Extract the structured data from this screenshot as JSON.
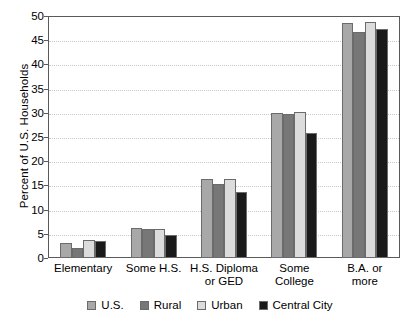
{
  "chart_data": {
    "type": "bar",
    "title": "",
    "xlabel": "",
    "ylabel": "Percent of U.S. Households",
    "ylim": [
      0,
      50
    ],
    "yticks": [
      0,
      5,
      10,
      15,
      20,
      25,
      30,
      35,
      40,
      45,
      50
    ],
    "ytick_labels": [
      "0",
      "5",
      "10",
      "15",
      "20",
      "25",
      "30",
      "35",
      "40",
      "45",
      "50"
    ],
    "grid": true,
    "grid_axis": "y",
    "legend_position": "bottom",
    "categories": [
      "Elementary",
      "Some H.S.",
      "H.S. Diploma or GED",
      "Some College",
      "B.A. or more"
    ],
    "category_lines": [
      [
        "Elementary",
        ""
      ],
      [
        "Some H.S.",
        ""
      ],
      [
        "H.S. Diploma",
        "or GED"
      ],
      [
        "Some",
        "College"
      ],
      [
        "B.A. or",
        "more"
      ]
    ],
    "series": [
      {
        "name": "U.S.",
        "color": "#a8a8a8",
        "values": [
          3.2,
          6.3,
          16.3,
          29.9,
          48.5
        ]
      },
      {
        "name": "Rural",
        "color": "#777777",
        "values": [
          2.1,
          6.0,
          15.2,
          29.8,
          46.8
        ]
      },
      {
        "name": "Urban",
        "color": "#dcdcdc",
        "values": [
          3.8,
          6.0,
          16.3,
          30.1,
          48.8
        ]
      },
      {
        "name": "Central City",
        "color": "#1a1a1a",
        "values": [
          3.5,
          4.8,
          13.6,
          25.9,
          47.3
        ]
      }
    ]
  }
}
